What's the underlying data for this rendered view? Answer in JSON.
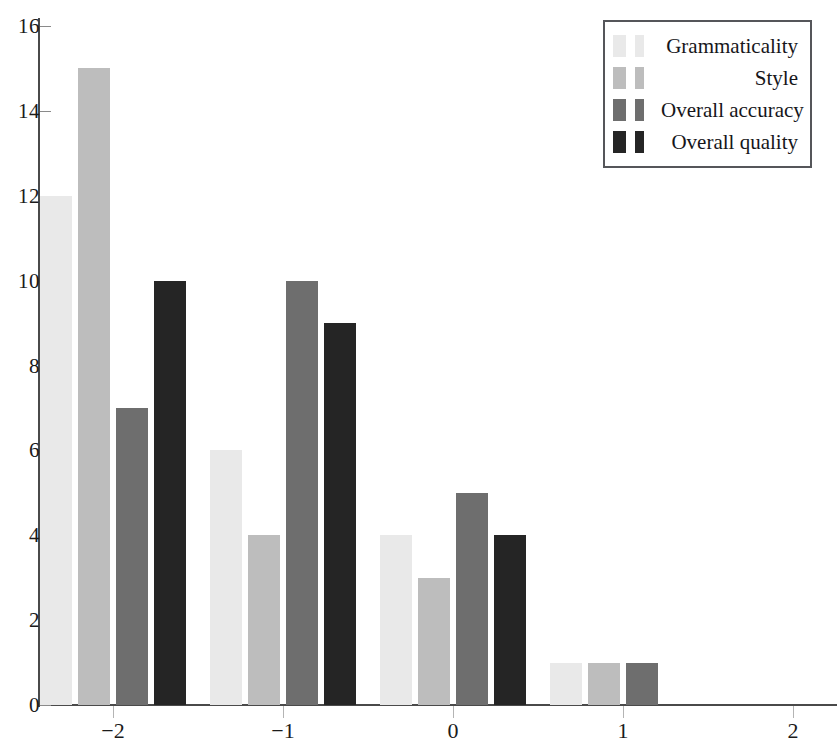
{
  "chart_data": {
    "type": "bar",
    "title": "",
    "xlabel": "",
    "ylabel": "",
    "categories": [
      "-2",
      "-1",
      "0",
      "1",
      "2"
    ],
    "series": [
      {
        "name": "Grammaticality",
        "color": "#e9e9e9",
        "values": [
          12,
          6,
          4,
          1,
          0
        ]
      },
      {
        "name": "Style",
        "color": "#bdbdbd",
        "values": [
          15,
          4,
          3,
          1,
          0
        ]
      },
      {
        "name": "Overall accuracy",
        "color": "#6e6e6e",
        "values": [
          7,
          10,
          5,
          1,
          0
        ]
      },
      {
        "name": "Overall quality",
        "color": "#252525",
        "values": [
          10,
          9,
          4,
          0,
          0
        ]
      }
    ],
    "ylim": [
      0,
      16
    ],
    "yticks": [
      0,
      2,
      4,
      6,
      8,
      10,
      12,
      14,
      16
    ],
    "ytick_labels": [
      "0",
      "2",
      "4",
      "6",
      "8",
      "10",
      "12",
      "14",
      "16"
    ],
    "xticks": [
      -2,
      -1,
      0,
      1,
      2
    ],
    "xtick_labels": [
      "−2",
      "−1",
      "0",
      "1",
      "2"
    ],
    "grid": false,
    "legend_position": "top-right",
    "legend_entries": [
      "Grammaticality",
      "Style",
      "Overall accuracy",
      "Overall quality"
    ],
    "axis_color": "#4a4a4a"
  }
}
